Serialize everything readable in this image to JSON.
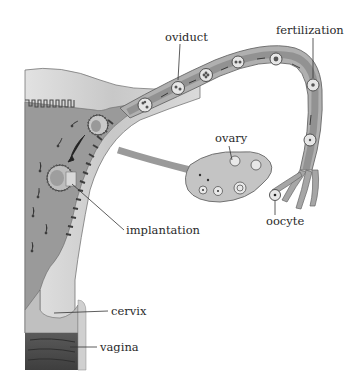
{
  "figure": {
    "labels": {
      "oviduct": "oviduct",
      "fertilization": "fertilization",
      "ovary": "ovary",
      "implantation": "implantation",
      "oocyte": "oocyte",
      "cervix": "cervix",
      "vagina": "vagina"
    },
    "colors": {
      "background": "#ffffff",
      "tissue_light": "#d4d4d4",
      "tissue_mid": "#a8a8a8",
      "tissue_dark": "#6a6a6a",
      "lumen": "#8c8c8c",
      "vagina_dark": "#4a4a4a",
      "text": "#2a2a2a"
    }
  }
}
